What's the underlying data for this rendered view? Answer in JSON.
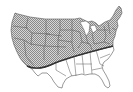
{
  "map": {
    "subject": "Contiguous United States",
    "regions": [
      {
        "name": "shaded-region",
        "description": "Northern and western states (hatched)",
        "fill": "#b8b8b8",
        "pattern": "checker"
      },
      {
        "name": "unshaded-region",
        "description": "Southern and southeastern states",
        "fill": "#ffffff"
      }
    ],
    "boundary": {
      "description": "Curved line from southern California to the mid-Atlantic coast",
      "color": "#333333"
    },
    "colors": {
      "state_border": "#555555",
      "hatch_dark": "#8a8a8a",
      "hatch_light": "#d6d6d6",
      "background": "#ffffff"
    }
  }
}
